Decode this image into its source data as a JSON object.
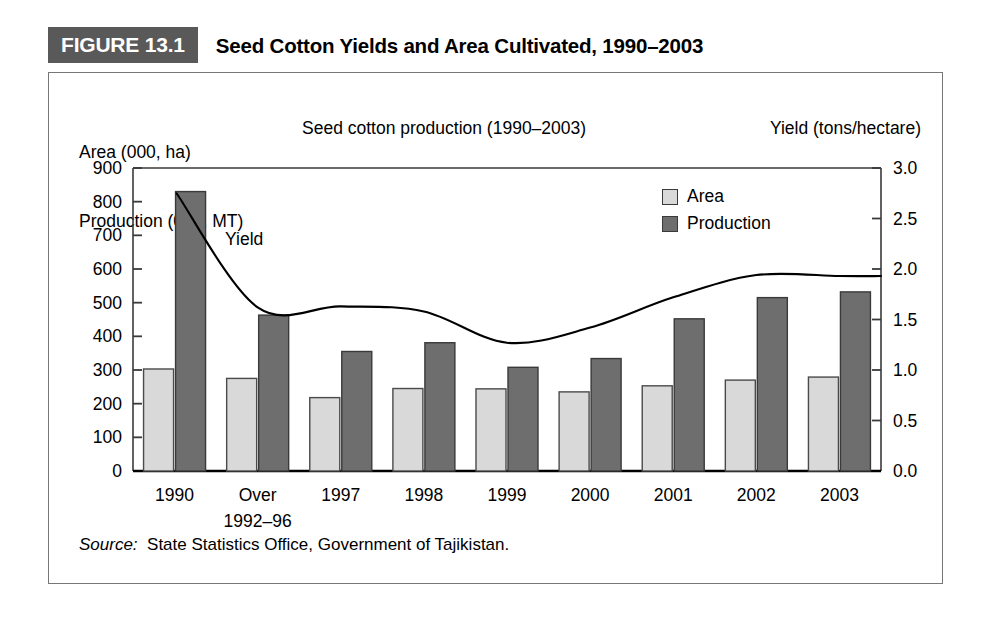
{
  "figure": {
    "tag": "FIGURE 13.1",
    "title": "Seed Cotton Yields and Area Cultivated, 1990–2003",
    "tag_bg": "#595959"
  },
  "captions": {
    "left_axis_line1": "Area (000, ha)",
    "left_axis_line2": "Production (000, MT)",
    "subtitle": "Seed cotton production (1990–2003)",
    "right_axis": "Yield (tons/hectare)"
  },
  "legend": {
    "items": [
      {
        "label": "Area",
        "color": "#d9d9d9"
      },
      {
        "label": "Production",
        "color": "#6e6e6e"
      }
    ]
  },
  "source": {
    "label": "Source:",
    "text": "State Statistics Office, Government of Tajikistan."
  },
  "chart_data": {
    "type": "bar",
    "title": "Seed cotton production (1990–2003)",
    "xlabel": "",
    "ylabel": "Area (000, ha) / Production (000, MT)",
    "y2label": "Yield (tons/hectare)",
    "ylim": [
      0,
      900
    ],
    "y2lim": [
      0.0,
      3.0
    ],
    "yticks": [
      0,
      100,
      200,
      300,
      400,
      500,
      600,
      700,
      800,
      900
    ],
    "ytick_labels": [
      "0",
      "100",
      "200",
      "300",
      "400",
      "500",
      "600",
      "700",
      "800",
      "900"
    ],
    "y2ticks": [
      0.0,
      0.5,
      1.0,
      1.5,
      2.0,
      2.5,
      3.0
    ],
    "y2tick_labels": [
      "0.0",
      "0.5",
      "1.0",
      "1.5",
      "2.0",
      "2.5",
      "3.0"
    ],
    "grid": false,
    "legend_position": "upper right",
    "categories": [
      "1990",
      "Over 1992–96",
      "1997",
      "1998",
      "1999",
      "2000",
      "2001",
      "2002",
      "2003"
    ],
    "category_lines": [
      [
        "1990"
      ],
      [
        "Over",
        "1992–96"
      ],
      [
        "1997"
      ],
      [
        "1998"
      ],
      [
        "1999"
      ],
      [
        "2000"
      ],
      [
        "2001"
      ],
      [
        "2002"
      ],
      [
        "2003"
      ]
    ],
    "series": [
      {
        "name": "Area",
        "axis": "left",
        "units": "000 ha",
        "color": "#d9d9d9",
        "values": [
          303,
          275,
          218,
          245,
          244,
          235,
          253,
          270,
          279
        ]
      },
      {
        "name": "Production",
        "axis": "left",
        "units": "000 MT",
        "color": "#6e6e6e",
        "values": [
          830,
          463,
          355,
          381,
          308,
          334,
          452,
          515,
          532
        ]
      },
      {
        "name": "Yield",
        "type": "line",
        "axis": "right",
        "units": "tons/hectare",
        "color": "#000000",
        "values": [
          2.75,
          1.62,
          1.63,
          1.58,
          1.27,
          1.42,
          1.72,
          1.94,
          1.93
        ]
      }
    ],
    "annotations": [
      {
        "text": "Yield",
        "series": "Yield"
      }
    ]
  }
}
